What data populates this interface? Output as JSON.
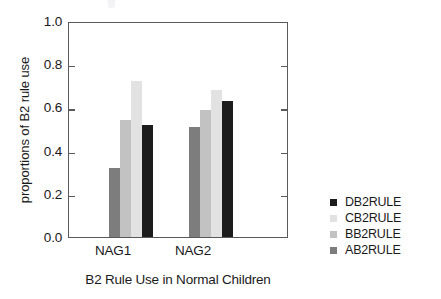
{
  "chart_data": {
    "type": "bar",
    "title": "",
    "xlabel": "B2 Rule Use in Normal Children",
    "ylabel": "proportions of B2 rule use",
    "categories": [
      "NAG1",
      "NAG2"
    ],
    "ylim": [
      0.0,
      1.0
    ],
    "yticks": [
      "1.0",
      "0.8",
      "0.6",
      "0.4",
      "0.2",
      "0.0"
    ],
    "ytick_values": [
      1.0,
      0.8,
      0.6,
      0.4,
      0.2,
      0.0
    ],
    "grid": false,
    "legend_position": "right",
    "series": [
      {
        "name": "AB2RULE",
        "color": "#7d7d7d",
        "values": [
          0.32,
          0.51
        ]
      },
      {
        "name": "BB2RULE",
        "color": "#c2c2c2",
        "values": [
          0.54,
          0.59
        ]
      },
      {
        "name": "CB2RULE",
        "color": "#e2e2e2",
        "values": [
          0.72,
          0.68
        ]
      },
      {
        "name": "DB2RULE",
        "color": "#1c1c1c",
        "values": [
          0.52,
          0.63
        ]
      }
    ],
    "legend_entries": [
      {
        "label": "DB2RULE",
        "color": "#1c1c1c"
      },
      {
        "label": "CB2RULE",
        "color": "#e2e2e2"
      },
      {
        "label": "BB2RULE",
        "color": "#c2c2c2"
      },
      {
        "label": "AB2RULE",
        "color": "#7d7d7d"
      }
    ]
  },
  "axis": {
    "ytick_0": "1.0",
    "ytick_1": "0.8",
    "ytick_2": "0.6",
    "ytick_3": "0.4",
    "ytick_4": "0.2",
    "ytick_5": "0.0",
    "ylabel": "proportions of B2 rule use",
    "xlabel": "B2 Rule Use in Normal Children",
    "xgroup_0": "NAG1",
    "xgroup_1": "NAG2"
  },
  "legend": {
    "row_0": "DB2RULE",
    "row_1": "CB2RULE",
    "row_2": "BB2RULE",
    "row_3": "AB2RULE"
  }
}
